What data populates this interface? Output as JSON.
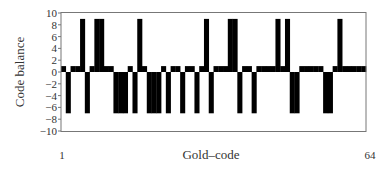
{
  "chart_data": {
    "type": "bar",
    "title": "",
    "xlabel": "Gold–code",
    "ylabel": "Code balance",
    "xlim": [
      1,
      64
    ],
    "ylim": [
      -10,
      10
    ],
    "x_tick_labels": [
      "1",
      "64"
    ],
    "y_ticks": [
      10,
      8,
      6,
      4,
      2,
      0,
      -2,
      -4,
      -6,
      -8,
      -10
    ],
    "y_tick_labels": [
      "10",
      "8",
      "6",
      "4",
      "2",
      "0",
      "−2",
      "−4",
      "−6",
      "−8",
      "−10"
    ],
    "grid": false,
    "legend": null,
    "bar_color": "#000000",
    "x": [
      1,
      2,
      3,
      4,
      5,
      6,
      7,
      8,
      9,
      10,
      11,
      12,
      13,
      14,
      15,
      16,
      17,
      18,
      19,
      20,
      21,
      22,
      23,
      24,
      25,
      26,
      27,
      28,
      29,
      30,
      31,
      32,
      33,
      34,
      35,
      36,
      37,
      38,
      39,
      40,
      41,
      42,
      43,
      44,
      45,
      46,
      47,
      48,
      49,
      50,
      51,
      52,
      53,
      54,
      55,
      56,
      57,
      58,
      59,
      60,
      61,
      62,
      63,
      64
    ],
    "values": [
      1,
      -7,
      1,
      1,
      9,
      -7,
      1,
      9,
      9,
      1,
      1,
      -7,
      -7,
      -7,
      1,
      -7,
      9,
      1,
      -7,
      -7,
      -7,
      1,
      -7,
      1,
      1,
      -7,
      1,
      1,
      -7,
      1,
      9,
      -7,
      1,
      1,
      1,
      9,
      9,
      -7,
      1,
      1,
      -7,
      1,
      1,
      1,
      1,
      9,
      1,
      9,
      -7,
      -7,
      1,
      1,
      1,
      1,
      1,
      -7,
      -7,
      1,
      9,
      1,
      1,
      1,
      1,
      1
    ]
  }
}
